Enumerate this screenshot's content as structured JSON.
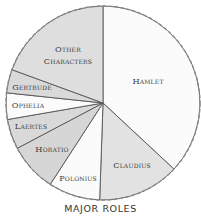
{
  "chart_data": {
    "type": "pie",
    "title": "MAJOR ROLES",
    "start_angle_deg": 0,
    "direction": "clockwise",
    "categories": [
      "Hamlet",
      "Claudius",
      "Polonius",
      "Horatio",
      "Laertes",
      "Ophelia",
      "Gertrude",
      "Other Characters"
    ],
    "values": [
      36.9,
      13.6,
      8.6,
      8.1,
      5.0,
      4.4,
      3.9,
      19.4
    ],
    "unit": "% of lines (estimated from slice angles)",
    "slices": [
      {
        "label": "Hamlet",
        "value": 36.9,
        "fill": "#fbfbfb",
        "label_lines": [
          "Hamlet"
        ],
        "label_pos": [
          148,
          84
        ]
      },
      {
        "label": "Claudius",
        "value": 13.6,
        "fill": "#e2e2e2",
        "label_lines": [
          "Claudius"
        ],
        "label_pos": [
          132,
          168
        ]
      },
      {
        "label": "Polonius",
        "value": 8.6,
        "fill": "#fbfbfb",
        "label_lines": [
          "Polonius"
        ],
        "label_pos": [
          78,
          181
        ]
      },
      {
        "label": "Horatio",
        "value": 8.1,
        "fill": "#d6d6d6",
        "label_lines": [
          "Horatio"
        ],
        "label_pos": [
          52,
          152
        ]
      },
      {
        "label": "Laertes",
        "value": 5.0,
        "fill": "#d9d9d9",
        "label_lines": [
          "Laertes"
        ],
        "label_pos": [
          31,
          129
        ]
      },
      {
        "label": "Ophelia",
        "value": 4.4,
        "fill": "#fbfbfb",
        "label_lines": [
          "Ophelia"
        ],
        "label_pos": [
          28,
          108
        ]
      },
      {
        "label": "Gertrude",
        "value": 3.9,
        "fill": "#d9d9d9",
        "label_lines": [
          "Gertrude"
        ],
        "label_pos": [
          32,
          90
        ]
      },
      {
        "label": "Other Characters",
        "value": 19.4,
        "fill": "#dedede",
        "label_lines": [
          "Other",
          "Characters"
        ],
        "label_pos": [
          68,
          52
        ]
      }
    ],
    "legend": null,
    "grid": false
  }
}
